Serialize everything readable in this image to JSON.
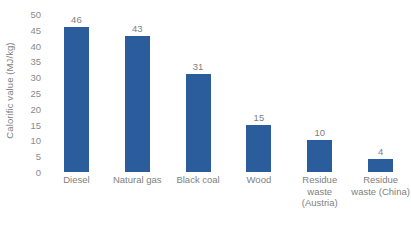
{
  "chart_data": {
    "type": "bar",
    "title": "",
    "subtitle": "",
    "xlabel": "",
    "ylabel": "Calorific value (MJ/kg)",
    "categories": [
      "Diesel",
      "Natural gas",
      "Black coal",
      "Wood",
      "Residue waste (Austria)",
      "Residue waste (China)"
    ],
    "values": [
      46,
      43,
      31,
      15,
      10,
      4
    ],
    "data_labels": [
      "46",
      "43",
      "31",
      "15",
      "10",
      "4"
    ],
    "ylim": [
      0,
      50
    ],
    "ytick_step": 5,
    "yticks": [
      "50",
      "45",
      "40",
      "35",
      "30",
      "25",
      "20",
      "15",
      "10",
      "5",
      "0"
    ],
    "ytick_values": [
      50,
      45,
      40,
      35,
      30,
      25,
      20,
      15,
      10,
      5,
      0
    ],
    "grid": false,
    "legend": false,
    "legend_position": "none",
    "series": [
      {
        "name": "Calorific value",
        "values": [
          46,
          43,
          31,
          15,
          10,
          4
        ],
        "color": "#2b5c9b"
      }
    ],
    "colors": {
      "bar": "#2b5c9b",
      "axis_text": "#808080",
      "tick_text": "#8a8a8a",
      "background": "#ffffff"
    }
  }
}
